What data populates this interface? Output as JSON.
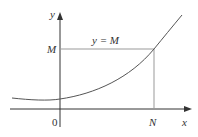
{
  "diagram": {
    "axes": {
      "x_label": "x",
      "y_label": "y",
      "origin_label": "0"
    },
    "horizontal_line": {
      "label": "y = M",
      "y_tick_label": "M"
    },
    "vertical_line": {
      "x_tick_label": "N"
    },
    "curve": {
      "description": "increasing convex curve with minimum slightly left of the y-axis, crossing y = M at x = N"
    },
    "colors": {
      "axes": "#333333",
      "guide_lines": "#999999",
      "curve": "#555555"
    }
  }
}
